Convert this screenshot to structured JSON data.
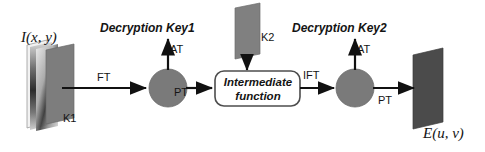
{
  "diagram": {
    "input_plane": {
      "label": "I(x, y)",
      "key_label": "K1",
      "fill": "#7d7d7d"
    },
    "key2_plane": {
      "label": "K2",
      "fill": "#808080"
    },
    "output_plane": {
      "label": "E(u, v)",
      "fill": "#4b4b4b"
    },
    "nodes": [
      {
        "name": "multiplier-1",
        "shape": "circle",
        "fill": "#7a7a7a"
      },
      {
        "name": "multiplier-2",
        "shape": "circle",
        "fill": "#7a7a7a"
      }
    ],
    "process_box": {
      "line1": "Intermediate",
      "line2": "function",
      "stroke": "#4d4d4d",
      "fill": "#ffffff"
    },
    "edges": [
      {
        "name": "ft",
        "label": "FT"
      },
      {
        "name": "pt-1",
        "label": "PT"
      },
      {
        "name": "at-1",
        "label": "AT"
      },
      {
        "name": "ift",
        "label": "IFT"
      },
      {
        "name": "at-2",
        "label": "AT"
      },
      {
        "name": "pt-2",
        "label": "PT"
      }
    ],
    "outputs": [
      {
        "name": "decryption-key-1",
        "label": "Decryption Key1"
      },
      {
        "name": "decryption-key-2",
        "label": "Decryption Key2"
      }
    ],
    "colors": {
      "stroke": "#111111",
      "text": "#141414"
    }
  }
}
